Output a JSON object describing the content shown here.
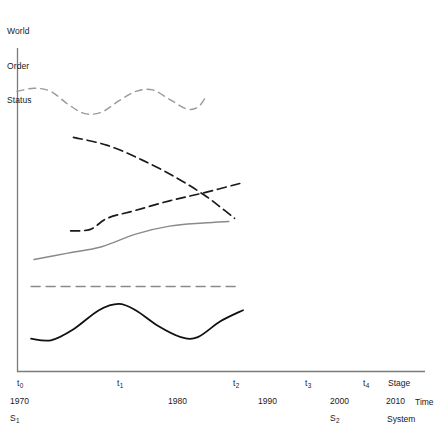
{
  "figure": {
    "background": "#ffffff",
    "axis_color": "#7b7b7b",
    "y_axis_title_line1": "World",
    "y_axis_title_line2": "Order",
    "y_axis_title_line3": "Status"
  },
  "axes": {
    "stage_row_label": "Stage",
    "time_row_label": "Time",
    "system_row_label": "System",
    "stage_ticks": [
      {
        "label": "t",
        "sub": "0",
        "x": 17
      },
      {
        "label": "t",
        "sub": "1",
        "x": 117
      },
      {
        "label": "t",
        "sub": "2",
        "x": 233
      },
      {
        "label": "t",
        "sub": "3",
        "x": 305
      },
      {
        "label": "t",
        "sub": "4",
        "x": 363
      }
    ],
    "time_ticks": [
      {
        "label": "1970",
        "x": 10
      },
      {
        "label": "1980",
        "x": 168
      },
      {
        "label": "1990",
        "x": 258
      },
      {
        "label": "2000",
        "x": 330
      },
      {
        "label": "2010",
        "x": 386
      }
    ],
    "system_ticks": [
      {
        "label": "S",
        "sub": "1",
        "x": 10
      },
      {
        "label": "S",
        "sub": "2",
        "x": 330
      }
    ]
  },
  "chart_data": {
    "type": "line",
    "title": "",
    "subtitle": "",
    "xlabel": "Stage / Time / System",
    "ylabel": "World Order Status",
    "grid": false,
    "legend_position": "none",
    "x_categories": [
      "t0",
      "t1",
      "t2",
      "t3",
      "t4"
    ],
    "x_time_labels": [
      "1970",
      "1980",
      "1990",
      "2000",
      "2010"
    ],
    "x_system_labels": [
      "S1",
      "S2"
    ],
    "xlim": [
      1970,
      2010
    ],
    "ylim": [
      0,
      10
    ],
    "note": "Five unlabeled trajectory curves plotted over stages t0 to roughly t2; values are qualitative positions on the World Order Status axis read off pixel geometry.",
    "series": [
      {
        "name": "wavy-dashed-gray-top",
        "style": "dashed",
        "color": "#9a9a9a",
        "width": 1.4,
        "dash": "7,5",
        "points": [
          [
            1970,
            8.85
          ],
          [
            1973,
            8.95
          ],
          [
            1976,
            8.85
          ],
          [
            1979,
            8.45
          ],
          [
            1982,
            8.15
          ],
          [
            1985,
            8.2
          ],
          [
            1988,
            8.55
          ],
          [
            1991,
            8.85
          ],
          [
            1994,
            8.9
          ],
          [
            1997,
            8.6
          ],
          [
            2000,
            8.3
          ],
          [
            2002,
            8.35
          ],
          [
            2003.5,
            8.7
          ]
        ]
      },
      {
        "name": "descending-dashed-black",
        "style": "dashed",
        "color": "#1a1a1a",
        "width": 1.7,
        "dash": "9,5",
        "points": [
          [
            1980,
            7.4
          ],
          [
            1986,
            7.15
          ],
          [
            1992,
            6.7
          ],
          [
            1998,
            6.15
          ],
          [
            2003,
            5.6
          ],
          [
            2006,
            5.2
          ],
          [
            2008.5,
            4.85
          ]
        ]
      },
      {
        "name": "ascending-dashed-black",
        "style": "dashed",
        "color": "#1a1a1a",
        "width": 1.7,
        "dash": "9,5",
        "points": [
          [
            1979.5,
            4.45
          ],
          [
            1983,
            4.5
          ],
          [
            1986,
            4.85
          ],
          [
            1991,
            5.1
          ],
          [
            1997,
            5.4
          ],
          [
            2003,
            5.65
          ],
          [
            2009.5,
            5.95
          ]
        ]
      },
      {
        "name": "rising-solid-gray",
        "style": "solid",
        "color": "#8a8a8a",
        "width": 1.4,
        "dash": "none",
        "points": [
          [
            1973,
            3.55
          ],
          [
            1979,
            3.75
          ],
          [
            1985,
            3.95
          ],
          [
            1991,
            4.35
          ],
          [
            1997,
            4.6
          ],
          [
            2003,
            4.7
          ],
          [
            2007.5,
            4.75
          ]
        ]
      },
      {
        "name": "flat-dashed-gray",
        "style": "dashed",
        "color": "#8a8a8a",
        "width": 1.5,
        "dash": "9,6",
        "points": [
          [
            1972.5,
            2.7
          ],
          [
            2009,
            2.7
          ]
        ]
      },
      {
        "name": "oscillating-solid-black",
        "style": "solid",
        "color": "#111111",
        "width": 1.8,
        "dash": "none",
        "points": [
          [
            1972.5,
            1.05
          ],
          [
            1976,
            1.0
          ],
          [
            1980,
            1.35
          ],
          [
            1984.5,
            1.95
          ],
          [
            1988,
            2.15
          ],
          [
            1991,
            1.95
          ],
          [
            1995,
            1.45
          ],
          [
            1999,
            1.1
          ],
          [
            2002,
            1.1
          ],
          [
            2006,
            1.6
          ],
          [
            2010,
            1.95
          ]
        ]
      }
    ]
  }
}
